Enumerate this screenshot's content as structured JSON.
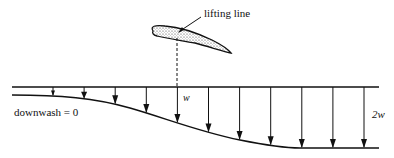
{
  "diagram": {
    "labels": {
      "lifting_line": "lifting line",
      "downwash_zero": "downwash = 0",
      "w": "w",
      "two_w": "2w"
    },
    "colors": {
      "ink": "#111111",
      "airfoil_fill": "#d6d6d6",
      "background": "#ffffff"
    },
    "arrow_count": 11,
    "downwash_profile": {
      "description": "Downwash increases from 0 far upstream to w at the lifting line and 2w far downstream",
      "upstream_value": "0",
      "at_lifting_line": "w",
      "downstream_value": "2w"
    }
  }
}
